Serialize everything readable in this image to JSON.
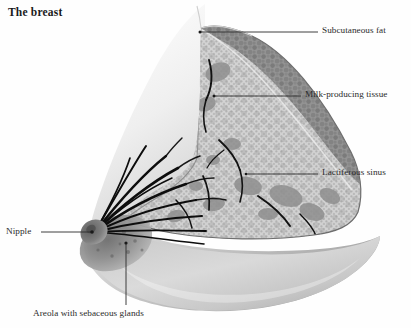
{
  "figure": {
    "title": "The breast",
    "type": "anatomical-cross-section-illustration",
    "subject": "breast",
    "background_color": "#fefefe",
    "ink_color": "#2b2b2b"
  },
  "annotations": [
    {
      "id": "subcutaneous-fat",
      "label": "Subcutaneous fat",
      "side": "right",
      "leader": {
        "x1": 200,
        "y1": 32,
        "x2": 318,
        "y2": 32
      }
    },
    {
      "id": "milk-producing-tissue",
      "label": "Milk-producing tissue",
      "side": "right",
      "leader": {
        "x1": 214,
        "y1": 96,
        "x2": 301,
        "y2": 96
      }
    },
    {
      "id": "lactiferous-sinus",
      "label": "Lactiferous sinus",
      "side": "right",
      "leader": {
        "x1": 246,
        "y1": 174,
        "x2": 318,
        "y2": 174
      }
    },
    {
      "id": "nipple",
      "label": "Nipple",
      "side": "left",
      "leader": {
        "x1": 92,
        "y1": 232,
        "x2": 41,
        "y2": 232
      }
    },
    {
      "id": "areola-with-sebaceous-glands",
      "label": "Areola with sebaceous glands",
      "side": "bottom",
      "leader": {
        "x1": 126,
        "y1": 243,
        "x2": 126,
        "y2": 305
      }
    }
  ],
  "tissue_regions": [
    {
      "id": "skin-surface",
      "name": "skin surface",
      "fill": "#d8d8d8"
    },
    {
      "id": "subcutaneous-fat",
      "name": "subcutaneous fat layer",
      "fill": "#9e9e9e"
    },
    {
      "id": "glandular-tissue",
      "name": "milk-producing tissue",
      "fill": "#c9c9c9"
    },
    {
      "id": "areola",
      "name": "areola",
      "fill": "#8a8a8a"
    },
    {
      "id": "nipple",
      "name": "nipple",
      "fill": "#7a7a7a"
    },
    {
      "id": "ducts",
      "name": "lactiferous ducts",
      "fill": "#111111"
    }
  ]
}
